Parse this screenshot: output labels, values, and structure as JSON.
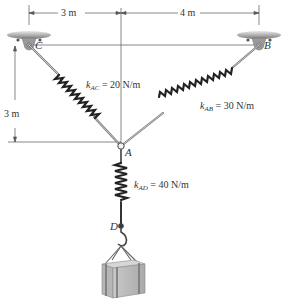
{
  "diagram": {
    "type": "spring-equilibrium",
    "dimensions": {
      "horizontal_left": "3 m",
      "horizontal_right": "4 m",
      "vertical_left": "3 m"
    },
    "points": {
      "A": "A",
      "B": "B",
      "C": "C",
      "D": "D"
    },
    "springs": [
      {
        "id": "AC",
        "k_symbol": "k",
        "subscript": "AC",
        "value": "= 20 N/m"
      },
      {
        "id": "AB",
        "k_symbol": "k",
        "subscript": "AB",
        "value": "= 30 N/m"
      },
      {
        "id": "AD",
        "k_symbol": "k",
        "subscript": "AD",
        "value": "= 40 N/m"
      }
    ],
    "colors": {
      "line": "#444444",
      "support": "#8a8a8a",
      "spring": "#222222",
      "crate": "#b8b8b8"
    }
  }
}
